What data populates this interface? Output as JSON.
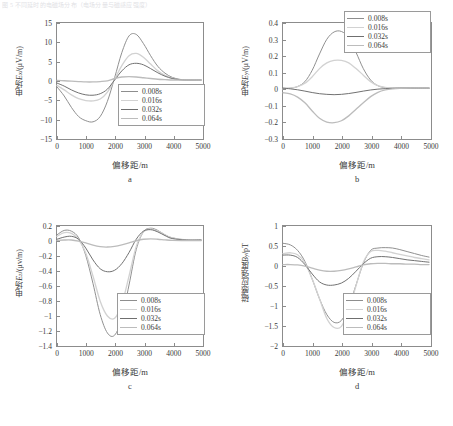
{
  "caption_line": "图 5 不同延时的电磁场分布（电场分量与磁感应强度）",
  "legend_labels": [
    "0.008s",
    "0.016s",
    "0.032s",
    "0.064s"
  ],
  "series_colors": [
    "#8e8e8e",
    "#d2d2d2",
    "#6f6f6f",
    "#bcbcbc"
  ],
  "axis_color": "#8c8c8c",
  "xlabel": "偏移距/m",
  "xticks": [
    "0",
    "1000",
    "2000",
    "3000",
    "4000",
    "5000"
  ],
  "panels": [
    {
      "letter": "a",
      "ylabel_cn": "电场",
      "ylabel_sym": "E",
      "ylabel_sub": "x",
      "ylabel_unit": "/(μV/m)",
      "yticks": [
        "15",
        "10",
        "5",
        "0",
        "-5",
        "-10",
        "-15"
      ]
    },
    {
      "letter": "b",
      "ylabel_cn": "电场",
      "ylabel_sym": "E",
      "ylabel_sub": "y",
      "ylabel_unit": "/(μV/m)",
      "yticks": [
        "0.4",
        "0.3",
        "0.2",
        "0.1",
        "0",
        "-0.1",
        "-0.2",
        "-0.3"
      ]
    },
    {
      "letter": "c",
      "ylabel_cn": "电场",
      "ylabel_sym": "E",
      "ylabel_sub": "z",
      "ylabel_unit": "/(μv/m)",
      "yticks": [
        "0.2",
        "0",
        "-0.2",
        "-0.4",
        "-0.6",
        "-0.8",
        "-1",
        "-1.2",
        "-1.4"
      ]
    },
    {
      "letter": "d",
      "ylabel_cn": "磁感应强度",
      "ylabel_sym": "B",
      "ylabel_sub": "y",
      "ylabel_unit": "/pT",
      "yticks": [
        "1",
        "0.5",
        "0",
        "-0.5",
        "-1",
        "-1.5",
        "-2"
      ]
    }
  ],
  "chart_data": [
    {
      "type": "line",
      "panel": "a",
      "title": "a",
      "xlabel": "偏移距/m",
      "ylabel": "电场Ex/(μV/m)",
      "xlim": [
        0,
        5000
      ],
      "ylim": [
        -15,
        15
      ],
      "grid": false,
      "legend_position": "lower-right",
      "x": [
        0,
        250,
        500,
        750,
        1000,
        1250,
        1500,
        1750,
        2000,
        2250,
        2500,
        2750,
        3000,
        3250,
        3500,
        3750,
        4000,
        4250,
        4500,
        5000
      ],
      "series": [
        {
          "name": "0.008s",
          "values": [
            -1.8,
            -4.2,
            -7.2,
            -9.6,
            -10.7,
            -11.0,
            -9.6,
            -5.6,
            0.6,
            7.2,
            11.6,
            12.0,
            9.6,
            6.4,
            3.6,
            1.8,
            0.7,
            0.2,
            0.0,
            0.0
          ]
        },
        {
          "name": "0.016s",
          "values": [
            -1.4,
            -2.6,
            -3.9,
            -4.9,
            -5.4,
            -5.5,
            -5.0,
            -3.2,
            0.2,
            3.8,
            6.4,
            7.0,
            6.0,
            4.2,
            2.4,
            1.2,
            0.5,
            0.1,
            0.0,
            0.0
          ]
        },
        {
          "name": "0.032s",
          "values": [
            -0.8,
            -1.6,
            -2.6,
            -3.4,
            -3.9,
            -4.0,
            -3.6,
            -2.4,
            0.0,
            2.4,
            4.0,
            4.4,
            4.0,
            3.0,
            1.9,
            1.0,
            0.4,
            0.1,
            0.0,
            0.0
          ]
        },
        {
          "name": "0.064s",
          "values": [
            -0.1,
            -0.2,
            -0.3,
            -0.4,
            -0.5,
            -0.5,
            -0.4,
            -0.2,
            0.4,
            0.8,
            0.9,
            0.8,
            0.6,
            0.4,
            0.2,
            0.1,
            0.0,
            0.0,
            0.0,
            0.0
          ]
        }
      ]
    },
    {
      "type": "line",
      "panel": "b",
      "title": "b",
      "xlabel": "偏移距/m",
      "ylabel": "电场Ey/(μV/m)",
      "xlim": [
        0,
        5000
      ],
      "ylim": [
        -0.3,
        0.4
      ],
      "grid": false,
      "legend_position": "upper-right",
      "x": [
        0,
        250,
        500,
        750,
        1000,
        1250,
        1500,
        1750,
        2000,
        2250,
        2500,
        2750,
        3000,
        3250,
        3500,
        3750,
        4000,
        4500,
        5000
      ],
      "series": [
        {
          "name": "0.008s",
          "values": [
            0.0,
            0.0,
            0.01,
            0.04,
            0.11,
            0.21,
            0.3,
            0.345,
            0.348,
            0.31,
            0.22,
            0.12,
            0.05,
            0.015,
            0.003,
            0.0,
            0.0,
            0.0,
            0.0
          ]
        },
        {
          "name": "0.016s",
          "values": [
            -0.005,
            0.0,
            0.01,
            0.03,
            0.07,
            0.12,
            0.155,
            0.17,
            0.17,
            0.155,
            0.12,
            0.08,
            0.04,
            0.015,
            0.005,
            0.0,
            0.0,
            0.0,
            0.0
          ]
        },
        {
          "name": "0.032s",
          "values": [
            0.0,
            -0.004,
            -0.01,
            -0.018,
            -0.027,
            -0.034,
            -0.038,
            -0.04,
            -0.038,
            -0.033,
            -0.026,
            -0.018,
            -0.011,
            -0.006,
            -0.003,
            -0.001,
            0.0,
            0.0,
            0.0
          ]
        },
        {
          "name": "0.064s",
          "values": [
            -0.028,
            -0.035,
            -0.055,
            -0.09,
            -0.14,
            -0.185,
            -0.208,
            -0.212,
            -0.2,
            -0.17,
            -0.13,
            -0.09,
            -0.052,
            -0.026,
            -0.011,
            -0.004,
            -0.001,
            0.0,
            0.0
          ]
        }
      ]
    },
    {
      "type": "line",
      "panel": "c",
      "title": "c",
      "xlabel": "偏移距/m",
      "ylabel": "电场Ez/(μv/m)",
      "xlim": [
        0,
        5000
      ],
      "ylim": [
        -1.4,
        0.2
      ],
      "grid": false,
      "legend_position": "lower-right",
      "x": [
        0,
        250,
        500,
        750,
        1000,
        1250,
        1500,
        1750,
        2000,
        2250,
        2500,
        2750,
        3000,
        3250,
        3500,
        3750,
        4000,
        4500,
        5000
      ],
      "series": [
        {
          "name": "0.008s",
          "values": [
            0.08,
            0.14,
            0.13,
            0.04,
            -0.2,
            -0.58,
            -1.0,
            -1.25,
            -1.28,
            -1.05,
            -0.6,
            -0.12,
            0.12,
            0.17,
            0.14,
            0.08,
            0.04,
            0.01,
            0.01
          ]
        },
        {
          "name": "0.016s",
          "values": [
            0.06,
            0.11,
            0.1,
            0.02,
            -0.17,
            -0.48,
            -0.82,
            -1.02,
            -1.05,
            -0.86,
            -0.48,
            -0.08,
            0.12,
            0.16,
            0.13,
            0.08,
            0.04,
            0.01,
            0.01
          ]
        },
        {
          "name": "0.032s",
          "values": [
            0.02,
            0.05,
            0.06,
            0.02,
            -0.1,
            -0.26,
            -0.38,
            -0.42,
            -0.4,
            -0.31,
            -0.16,
            0.02,
            0.13,
            0.15,
            0.12,
            0.07,
            0.03,
            0.01,
            0.01
          ]
        },
        {
          "name": "0.064s",
          "values": [
            0.005,
            0.01,
            0.01,
            -0.005,
            -0.03,
            -0.06,
            -0.08,
            -0.085,
            -0.075,
            -0.055,
            -0.03,
            0.0,
            0.02,
            0.025,
            0.02,
            0.012,
            0.006,
            0.002,
            0.001
          ]
        }
      ]
    },
    {
      "type": "line",
      "panel": "d",
      "title": "d",
      "xlabel": "偏移距/m",
      "ylabel": "磁感应强度By/pT",
      "xlim": [
        0,
        5000
      ],
      "ylim": [
        -2,
        1
      ],
      "grid": false,
      "legend_position": "lower-right",
      "x": [
        0,
        250,
        500,
        750,
        1000,
        1250,
        1500,
        1750,
        2000,
        2250,
        2500,
        2750,
        3000,
        3250,
        3500,
        3750,
        4000,
        4250,
        4500,
        4750,
        5000
      ],
      "series": [
        {
          "name": "0.008s",
          "values": [
            0.56,
            0.52,
            0.38,
            0.1,
            -0.35,
            -0.85,
            -1.25,
            -1.45,
            -1.4,
            -1.05,
            -0.5,
            0.05,
            0.38,
            0.44,
            0.45,
            0.44,
            0.4,
            0.35,
            0.3,
            0.25,
            0.21
          ]
        },
        {
          "name": "0.016s",
          "values": [
            0.3,
            0.32,
            0.27,
            0.06,
            -0.35,
            -0.85,
            -1.35,
            -1.58,
            -1.55,
            -1.15,
            -0.52,
            0.08,
            0.35,
            0.38,
            0.36,
            0.32,
            0.28,
            0.24,
            0.2,
            0.17,
            0.14
          ]
        },
        {
          "name": "0.032s",
          "values": [
            0.26,
            0.26,
            0.2,
            0.02,
            -0.22,
            -0.42,
            -0.5,
            -0.5,
            -0.45,
            -0.33,
            -0.15,
            0.04,
            0.18,
            0.22,
            0.22,
            0.2,
            0.17,
            0.14,
            0.12,
            0.1,
            0.08
          ]
        },
        {
          "name": "0.064s",
          "values": [
            0.02,
            0.02,
            0.01,
            -0.02,
            -0.07,
            -0.12,
            -0.15,
            -0.15,
            -0.13,
            -0.09,
            -0.04,
            0.01,
            0.04,
            0.05,
            0.05,
            0.04,
            0.04,
            0.03,
            0.03,
            0.02,
            0.02
          ]
        }
      ]
    }
  ]
}
